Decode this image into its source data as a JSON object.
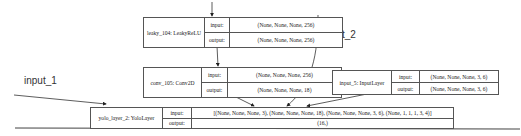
{
  "diagram": {
    "type": "keras-model-plot",
    "free_labels": {
      "input_1": "input_1",
      "input_2": "input_2"
    },
    "nodes": [
      {
        "id": "leaky_104",
        "label": "leaky_104: LeakyReLU",
        "input_label": "input:",
        "output_label": "output:",
        "input": "(None, None, None, 256)",
        "output": "(None, None, None, 256)"
      },
      {
        "id": "conv_105",
        "label": "conv_105: Conv2D",
        "input_label": "input:",
        "output_label": "output:",
        "input": "(None, None, None, 256)",
        "output": "(None, None, None, 18)"
      },
      {
        "id": "input_5",
        "label": "input_5: InputLayer",
        "input_label": "input:",
        "output_label": "output:",
        "input": "(None, None, None, 3, 6)",
        "output": "(None, None, None, 3, 6)"
      },
      {
        "id": "yolo_layer_2",
        "label": "yolo_layer_2: YoloLayer",
        "input_label": "input:",
        "output_label": "output:",
        "input": "[(None, None, None, 3), (None, None, None, 18), (None, None, None, 3, 6), (None, 1, 1, 1, 3, 4)]",
        "output": "(16,)"
      }
    ],
    "edges": [
      {
        "from": "above",
        "to": "leaky_104"
      },
      {
        "from": "leaky_104",
        "to": "conv_105"
      },
      {
        "from": "conv_105",
        "to": "yolo_layer_2"
      },
      {
        "from": "input_2",
        "to": "yolo_layer_2"
      },
      {
        "from": "input_5",
        "to": "yolo_layer_2"
      },
      {
        "from": "input_1",
        "to": "yolo_layer_2"
      }
    ],
    "colors": {
      "line": "#555555",
      "background": "#ffffff"
    }
  }
}
